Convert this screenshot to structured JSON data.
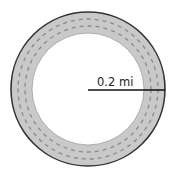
{
  "diagram": {
    "type": "annular-track",
    "radius_label": "0.2 mi",
    "colors": {
      "track_fill": "#c9c9c9",
      "outline": "#333333",
      "lane_dash": "#8a8a8a",
      "inner_fill": "#ffffff",
      "radius_line": "#111111"
    },
    "geometry": {
      "center": [
        88,
        89
      ],
      "outer_radius": 77,
      "inner_radius": 56,
      "lane_radii": [
        63,
        70
      ],
      "radius_line_from": [
        88,
        90
      ],
      "radius_line_to": [
        165,
        90
      ]
    }
  }
}
